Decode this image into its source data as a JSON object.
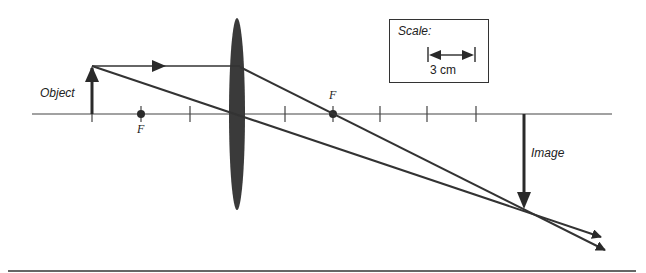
{
  "diagram": {
    "type": "ray-diagram-converging-lens",
    "labels": {
      "object": "Object",
      "image": "Image",
      "focal_left": "F",
      "focal_right": "F"
    },
    "scale": {
      "title": "Scale:",
      "value": "3 cm"
    },
    "colors": {
      "ink": "#333333",
      "lens": "#3a3a3a",
      "background": "#ffffff"
    }
  }
}
